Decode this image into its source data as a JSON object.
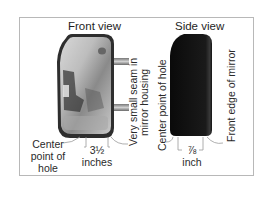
{
  "diagram": {
    "front_view": {
      "title": "Front view",
      "seam_label_line1": "Very small seam in",
      "seam_label_line2": "mirror housing",
      "center_label_line1": "Center",
      "center_label_line2": "point of",
      "center_label_line3": "hole",
      "dimension_value": "3½",
      "dimension_unit": "inches"
    },
    "side_view": {
      "title": "Side view",
      "center_label": "Center point of hole",
      "front_edge_label": "Front edge of mirror",
      "dimension_value": "⅞",
      "dimension_unit": "inch"
    },
    "colors": {
      "frame": "#b8b8b8",
      "mirror_body": "#3a3a3a",
      "side_body": "#111111",
      "leader_lines": "#999999"
    }
  }
}
